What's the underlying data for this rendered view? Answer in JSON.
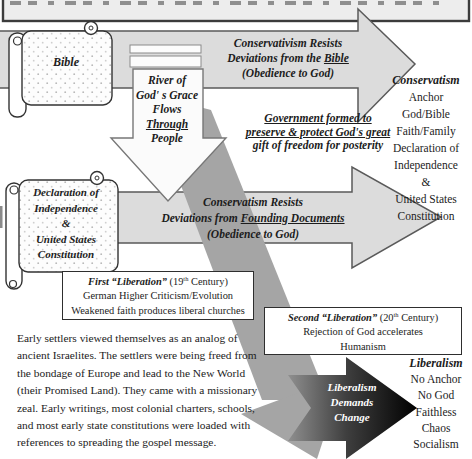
{
  "bible_scroll": {
    "label": "Bible"
  },
  "arrow1": {
    "line1": "Conservativism Resists",
    "line2_pre": "Deviations from the ",
    "line2_underline": "Bible",
    "line3": "(Obedience to God)"
  },
  "river_arrow": {
    "line1": "River of",
    "line2": "God' s Grace",
    "line3": "Flows",
    "line4": "Through",
    "line5": "People"
  },
  "government_note": {
    "line1": "Government formed to",
    "line2": "preserve & protect God's great",
    "line3": "gift of freedom for posterity"
  },
  "conservatism_column": {
    "title": "Conservatism",
    "items": [
      "Anchor",
      "God/Bible",
      "Faith/Family",
      "Declaration of",
      "Independence",
      "&",
      "United States",
      "Constitution"
    ]
  },
  "declaration_scroll": {
    "line1": "Declaration of",
    "line2": "Independence",
    "line3": "&",
    "line4": "United States",
    "line5": "Constitution"
  },
  "arrow2": {
    "line1": "Conservatism Resists",
    "line2_pre": "Deviations from ",
    "line2_underline": "Founding Documents",
    "line3": "(Obedience to God)"
  },
  "first_liberation_box": {
    "title_bold": "First “Liberation”",
    "title_pre": " (19",
    "title_sup": "th",
    "title_post": " Century)",
    "line2": "German Higher Criticism/Evolution",
    "line3": "Weakened faith produces liberal churches"
  },
  "second_liberation_box": {
    "title_bold": "Second “Liberation”",
    "title_pre": " (20",
    "title_sup": "th",
    "title_post": " Century)",
    "line2": "Rejection of God accelerates",
    "line3": "Humanism"
  },
  "liberalism_column": {
    "title": "Liberalism",
    "items": [
      "No Anchor",
      "No God",
      "Faithless",
      "Chaos",
      "Socialism"
    ]
  },
  "liberalism_arrow": {
    "line1": "Liberalism",
    "line2": "Demands",
    "line3": "Change"
  },
  "settlers_paragraph": {
    "text": "Early settlers viewed themselves as an analog of ancient Israelites. The settlers were being freed from the bondage of Europe and lead to the New World (their Promised Land). They came with a missionary zeal. Early writings, most colonial charters, schools, and most early state constitutions were loaded with references to spreading the gospel message."
  },
  "colors": {
    "arrow_gray": "#dcdcdc",
    "diagonal_gray": "#a5a5a5",
    "black_arrow": "#000000",
    "banner_fill": "#ededed"
  }
}
